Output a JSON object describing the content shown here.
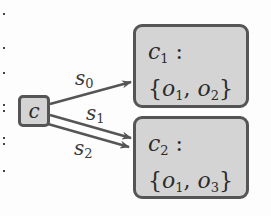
{
  "diagram": {
    "source_node": {
      "label": "c"
    },
    "target_nodes": [
      {
        "name": "c",
        "subscript": "1",
        "colon": " :",
        "set_open": "{",
        "elements": [
          {
            "name": "o",
            "subscript": "1"
          },
          {
            "name": "o",
            "subscript": "2"
          }
        ],
        "separator": ", ",
        "set_close": "}"
      },
      {
        "name": "c",
        "subscript": "2",
        "colon": " :",
        "set_open": "{",
        "elements": [
          {
            "name": "o",
            "subscript": "1"
          },
          {
            "name": "o",
            "subscript": "3"
          }
        ],
        "separator": ", ",
        "set_close": "}"
      }
    ],
    "edges": [
      {
        "from": "c",
        "to": "c1",
        "label": "s",
        "subscript": "0"
      },
      {
        "from": "c",
        "to": "c2",
        "label": "s",
        "subscript": "1"
      },
      {
        "from": "c",
        "to": "c2",
        "label": "s",
        "subscript": "2"
      }
    ],
    "colors": {
      "node_fill": "#d4d4d4",
      "node_border": "#555555",
      "edge": "#555555",
      "text": "#2b2b2b"
    }
  }
}
